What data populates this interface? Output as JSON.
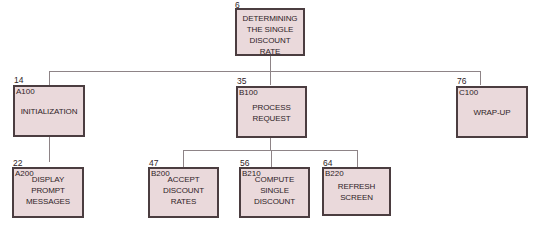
{
  "diagram": {
    "type": "hierarchy-chart",
    "colors": {
      "box_fill": "#ead9db",
      "box_border": "#4b3d40",
      "connector": "#8e8487"
    },
    "root": {
      "step": "6",
      "code": "",
      "title": "DETERMINING THE SINGLE DISCOUNT RATE",
      "children": [
        "A100",
        "B100",
        "C100"
      ]
    },
    "modules": [
      {
        "id": "A100",
        "step": "14",
        "code": "A100",
        "title": "INITIALIZATION",
        "parent": "root"
      },
      {
        "id": "B100",
        "step": "35",
        "code": "B100",
        "title": "PROCESS REQUEST",
        "parent": "root"
      },
      {
        "id": "C100",
        "step": "76",
        "code": "C100",
        "title": "WRAP-UP",
        "parent": "root"
      },
      {
        "id": "A200",
        "step": "22",
        "code": "A200",
        "title": "DISPLAY PROMPT MESSAGES",
        "parent": "A100"
      },
      {
        "id": "B200",
        "step": "47",
        "code": "B200",
        "title": "ACCEPT DISCOUNT RATES",
        "parent": "B100"
      },
      {
        "id": "B210",
        "step": "56",
        "code": "B210",
        "title": "COMPUTE SINGLE DISCOUNT",
        "parent": "B100"
      },
      {
        "id": "B220",
        "step": "64",
        "code": "B220",
        "title": "REFRESH SCREEN",
        "parent": "B100"
      }
    ],
    "labels": {
      "root_title_lines": [
        "DETERMINING",
        "THE SINGLE",
        "DISCOUNT",
        "RATE"
      ],
      "A100_lines": [
        "INITIALIZATION"
      ],
      "B100_lines": [
        "PROCESS",
        "REQUEST"
      ],
      "C100_lines": [
        "WRAP-UP"
      ],
      "A200_lines": [
        "DISPLAY",
        "PROMPT",
        "MESSAGES"
      ],
      "B200_lines": [
        "ACCEPT",
        "DISCOUNT",
        "RATES"
      ],
      "B210_lines": [
        "COMPUTE",
        "SINGLE",
        "DISCOUNT"
      ],
      "B220_lines": [
        "REFRESH",
        "SCREEN"
      ]
    }
  }
}
